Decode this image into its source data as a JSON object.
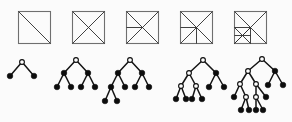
{
  "figure": {
    "background_color": "#fbfbfb",
    "width": 292,
    "height": 122,
    "colors": {
      "square_outline": "#6f6f6f",
      "subdivision_line": "#2b2b2b",
      "tree_edge": "#141414",
      "node_filled": "#0d0d0d",
      "node_open": "#fdfdfd"
    },
    "columns": 5,
    "rows": [
      {
        "name": "squares-row",
        "label": "Subdivided squares"
      },
      {
        "name": "trees-row",
        "label": "Binary trees"
      }
    ]
  },
  "squares": [
    {
      "index": 1,
      "name": "square-1",
      "label": "Square with one diagonal",
      "origin": [
        18,
        11
      ],
      "size": 32,
      "cuts": [
        {
          "name": "main-diagonal",
          "from": [
            0,
            0
          ],
          "to": [
            32,
            32
          ]
        }
      ]
    },
    {
      "index": 2,
      "name": "square-2",
      "label": "Square with both diagonals",
      "origin": [
        72,
        11
      ],
      "size": 32,
      "cuts": [
        {
          "name": "main-diagonal",
          "from": [
            0,
            0
          ],
          "to": [
            32,
            32
          ]
        },
        {
          "name": "anti-diagonal",
          "from": [
            32,
            0
          ],
          "to": [
            0,
            32
          ]
        }
      ]
    },
    {
      "index": 3,
      "name": "square-3",
      "label": "Both diagonals plus left horizontal bisector",
      "origin": [
        126,
        11
      ],
      "size": 32,
      "cuts": [
        {
          "name": "main-diagonal",
          "from": [
            0,
            0
          ],
          "to": [
            32,
            32
          ]
        },
        {
          "name": "anti-diagonal",
          "from": [
            32,
            0
          ],
          "to": [
            0,
            32
          ]
        },
        {
          "name": "left-horizontal-bisector",
          "from": [
            0,
            16
          ],
          "to": [
            16,
            16
          ]
        }
      ]
    },
    {
      "index": 4,
      "name": "square-4",
      "label": "Both diagonals plus left horizontal and bottom vertical bisectors",
      "origin": [
        180,
        11
      ],
      "size": 32,
      "cuts": [
        {
          "name": "main-diagonal",
          "from": [
            0,
            0
          ],
          "to": [
            32,
            32
          ]
        },
        {
          "name": "anti-diagonal",
          "from": [
            32,
            0
          ],
          "to": [
            0,
            32
          ]
        },
        {
          "name": "left-horizontal-bisector",
          "from": [
            0,
            16
          ],
          "to": [
            16,
            16
          ]
        },
        {
          "name": "bottom-vertical-bisector",
          "from": [
            16,
            16
          ],
          "to": [
            16,
            32
          ]
        }
      ]
    },
    {
      "index": 5,
      "name": "square-5",
      "label": "Both diagonals, bisectors, plus lower-left quadrant cross",
      "origin": [
        234,
        11
      ],
      "size": 32,
      "cuts": [
        {
          "name": "main-diagonal",
          "from": [
            0,
            0
          ],
          "to": [
            32,
            32
          ]
        },
        {
          "name": "anti-diagonal",
          "from": [
            32,
            0
          ],
          "to": [
            0,
            32
          ]
        },
        {
          "name": "left-horizontal-bisector",
          "from": [
            0,
            16
          ],
          "to": [
            16,
            16
          ]
        },
        {
          "name": "bottom-vertical-bisector",
          "from": [
            16,
            16
          ],
          "to": [
            16,
            32
          ]
        },
        {
          "name": "quadrant-horizontal",
          "from": [
            0,
            24
          ],
          "to": [
            16,
            24
          ]
        },
        {
          "name": "quadrant-diagonal",
          "from": [
            0,
            16
          ],
          "to": [
            16,
            32
          ]
        },
        {
          "name": "quadrant-anti-diagonal",
          "from": [
            16,
            16
          ],
          "to": [
            0,
            32
          ]
        }
      ]
    }
  ],
  "trees": [
    {
      "index": 1,
      "name": "tree-1",
      "label": "Tree with root and two leaves",
      "depth": 2,
      "node_count": 3,
      "leaf_count": 2,
      "nodes": [
        {
          "id": "r",
          "name": "root-node",
          "type": "open",
          "x": 22,
          "y": 62
        },
        {
          "id": "a",
          "name": "leaf-node",
          "type": "filled",
          "x": 10,
          "y": 76
        },
        {
          "id": "b",
          "name": "leaf-node",
          "type": "filled",
          "x": 34,
          "y": 76
        }
      ],
      "edges": [
        [
          "r",
          "a"
        ],
        [
          "r",
          "b"
        ]
      ]
    },
    {
      "index": 2,
      "name": "tree-2",
      "label": "Balanced tree of depth three",
      "depth": 3,
      "node_count": 7,
      "leaf_count": 4,
      "nodes": [
        {
          "id": "r",
          "name": "root-node",
          "type": "open",
          "x": 76,
          "y": 60
        },
        {
          "id": "l",
          "name": "internal-node",
          "type": "filled",
          "x": 64,
          "y": 73
        },
        {
          "id": "rr",
          "name": "internal-node",
          "type": "filled",
          "x": 88,
          "y": 73
        },
        {
          "id": "l1",
          "name": "leaf-node",
          "type": "filled",
          "x": 57,
          "y": 87
        },
        {
          "id": "l2",
          "name": "leaf-node",
          "type": "filled",
          "x": 71,
          "y": 87
        },
        {
          "id": "r1",
          "name": "leaf-node",
          "type": "filled",
          "x": 81,
          "y": 87
        },
        {
          "id": "r2",
          "name": "leaf-node",
          "type": "filled",
          "x": 95,
          "y": 87
        }
      ],
      "edges": [
        [
          "r",
          "l"
        ],
        [
          "r",
          "rr"
        ],
        [
          "l",
          "l1"
        ],
        [
          "l",
          "l2"
        ],
        [
          "rr",
          "r1"
        ],
        [
          "rr",
          "r2"
        ]
      ]
    },
    {
      "index": 3,
      "name": "tree-3",
      "label": "Tree of depth four with deepened left branch",
      "depth": 4,
      "node_count": 9,
      "leaf_count": 5,
      "nodes": [
        {
          "id": "r",
          "name": "root-node",
          "type": "open",
          "x": 130,
          "y": 60
        },
        {
          "id": "l",
          "name": "internal-node",
          "type": "filled",
          "x": 118,
          "y": 73
        },
        {
          "id": "rr",
          "name": "internal-node",
          "type": "filled",
          "x": 142,
          "y": 73
        },
        {
          "id": "l1",
          "name": "internal-node",
          "type": "filled",
          "x": 111,
          "y": 87
        },
        {
          "id": "l2",
          "name": "leaf-node",
          "type": "filled",
          "x": 125,
          "y": 87
        },
        {
          "id": "r1",
          "name": "leaf-node",
          "type": "filled",
          "x": 135,
          "y": 87
        },
        {
          "id": "r2",
          "name": "leaf-node",
          "type": "filled",
          "x": 149,
          "y": 87
        },
        {
          "id": "d1",
          "name": "leaf-node",
          "type": "filled",
          "x": 105,
          "y": 101
        },
        {
          "id": "d2",
          "name": "leaf-node",
          "type": "filled",
          "x": 117,
          "y": 101
        }
      ],
      "edges": [
        [
          "r",
          "l"
        ],
        [
          "r",
          "rr"
        ],
        [
          "l",
          "l1"
        ],
        [
          "l",
          "l2"
        ],
        [
          "rr",
          "r1"
        ],
        [
          "rr",
          "r2"
        ],
        [
          "l1",
          "d1"
        ],
        [
          "l1",
          "d2"
        ]
      ]
    },
    {
      "index": 4,
      "name": "tree-4",
      "label": "Tree of depth four with two open internal nodes",
      "depth": 4,
      "node_count": 11,
      "leaf_count": 6,
      "nodes": [
        {
          "id": "r",
          "name": "root-node",
          "type": "open",
          "x": 203,
          "y": 60
        },
        {
          "id": "l",
          "name": "internal-node",
          "type": "open",
          "x": 189,
          "y": 73
        },
        {
          "id": "rr",
          "name": "internal-node",
          "type": "filled",
          "x": 216,
          "y": 73
        },
        {
          "id": "la",
          "name": "internal-node",
          "type": "open",
          "x": 181,
          "y": 86
        },
        {
          "id": "lb",
          "name": "internal-node",
          "type": "open",
          "x": 196,
          "y": 86
        },
        {
          "id": "r1",
          "name": "leaf-node",
          "type": "filled",
          "x": 209,
          "y": 87
        },
        {
          "id": "r2",
          "name": "leaf-node",
          "type": "filled",
          "x": 224,
          "y": 87
        },
        {
          "id": "la1",
          "name": "leaf-node",
          "type": "filled",
          "x": 176,
          "y": 99
        },
        {
          "id": "la2",
          "name": "leaf-node",
          "type": "filled",
          "x": 186,
          "y": 99
        },
        {
          "id": "lb1",
          "name": "leaf-node",
          "type": "filled",
          "x": 192,
          "y": 99
        },
        {
          "id": "lb2",
          "name": "leaf-node",
          "type": "filled",
          "x": 202,
          "y": 99
        }
      ],
      "edges": [
        [
          "r",
          "l"
        ],
        [
          "r",
          "rr"
        ],
        [
          "l",
          "la"
        ],
        [
          "l",
          "lb"
        ],
        [
          "rr",
          "r1"
        ],
        [
          "rr",
          "r2"
        ],
        [
          "la",
          "la1"
        ],
        [
          "la",
          "la2"
        ],
        [
          "lb",
          "lb1"
        ],
        [
          "lb",
          "lb2"
        ]
      ]
    },
    {
      "index": 5,
      "name": "tree-5",
      "label": "Tree of depth five with deepest left subtree",
      "depth": 5,
      "node_count": 15,
      "leaf_count": 8,
      "nodes": [
        {
          "id": "r",
          "name": "root-node",
          "type": "open",
          "x": 262,
          "y": 59
        },
        {
          "id": "l",
          "name": "internal-node",
          "type": "open",
          "x": 248,
          "y": 71
        },
        {
          "id": "rr",
          "name": "internal-node",
          "type": "filled",
          "x": 275,
          "y": 71
        },
        {
          "id": "la",
          "name": "internal-node",
          "type": "open",
          "x": 240,
          "y": 84
        },
        {
          "id": "lb",
          "name": "internal-node",
          "type": "open",
          "x": 256,
          "y": 84
        },
        {
          "id": "r1",
          "name": "leaf-node",
          "type": "filled",
          "x": 268,
          "y": 85
        },
        {
          "id": "r2",
          "name": "leaf-node",
          "type": "filled",
          "x": 283,
          "y": 85
        },
        {
          "id": "la1",
          "name": "leaf-node",
          "type": "filled",
          "x": 234,
          "y": 97
        },
        {
          "id": "la2",
          "name": "internal-node",
          "type": "open",
          "x": 246,
          "y": 97
        },
        {
          "id": "lb1",
          "name": "internal-node",
          "type": "open",
          "x": 256,
          "y": 97
        },
        {
          "id": "lb2",
          "name": "leaf-node",
          "type": "filled",
          "x": 266,
          "y": 97
        },
        {
          "id": "d1",
          "name": "leaf-node",
          "type": "filled",
          "x": 241,
          "y": 110
        },
        {
          "id": "d2",
          "name": "leaf-node",
          "type": "filled",
          "x": 249,
          "y": 110
        },
        {
          "id": "d3",
          "name": "leaf-node",
          "type": "filled",
          "x": 256,
          "y": 110
        },
        {
          "id": "d4",
          "name": "leaf-node",
          "type": "filled",
          "x": 263,
          "y": 110
        }
      ],
      "edges": [
        [
          "r",
          "l"
        ],
        [
          "r",
          "rr"
        ],
        [
          "l",
          "la"
        ],
        [
          "l",
          "lb"
        ],
        [
          "rr",
          "r1"
        ],
        [
          "rr",
          "r2"
        ],
        [
          "la",
          "la1"
        ],
        [
          "la",
          "la2"
        ],
        [
          "lb",
          "lb1"
        ],
        [
          "lb",
          "lb2"
        ],
        [
          "la2",
          "d1"
        ],
        [
          "la2",
          "d2"
        ],
        [
          "lb1",
          "d3"
        ],
        [
          "lb1",
          "d4"
        ]
      ]
    }
  ]
}
